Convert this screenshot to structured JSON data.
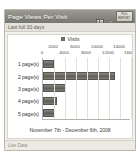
{
  "widget": {
    "title": "Page Views Per Visit",
    "subtitle": "Last full 30 days",
    "footer_link": "Live Data",
    "icons": {
      "table_view": "table-icon",
      "edit": "pencil-icon",
      "full_report_line1": "FULL",
      "full_report_line2": "REPORT"
    },
    "colors": {
      "titlebar": "#86857e",
      "bar": "#5e5d57",
      "panel_background": "#ffffff",
      "frame": "#f3f2ee"
    }
  },
  "chart_data": {
    "type": "bar",
    "orientation": "horizontal",
    "title": "Page Views Per Visit",
    "legend": [
      "Visits"
    ],
    "legend_position": "top-center",
    "categories": [
      "1 page(s)",
      "2 page(s)",
      "3 page(s)",
      "4 page(s)",
      "5 page(s)"
    ],
    "values": [
      2000,
      13000,
      4200,
      2600,
      2100
    ],
    "xlabel": "",
    "ylabel": "",
    "xlim": [
      0,
      16000
    ],
    "xticks": [
      0,
      2000,
      4000,
      6000,
      8000,
      10000,
      12000,
      14000,
      16000
    ],
    "xticklabels": [
      "0",
      "2000",
      "4000",
      "6000",
      "8000",
      "10000",
      "12000",
      "14000",
      "16000"
    ],
    "grid": true,
    "annotation": "November 7th - December 6th, 2008"
  }
}
